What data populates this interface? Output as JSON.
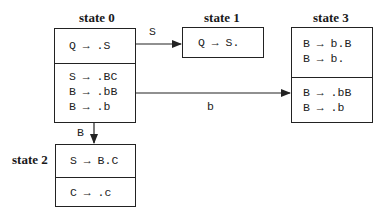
{
  "states": [
    {
      "title": "state 0",
      "kernel": [
        "Q → .S"
      ],
      "closure": [
        "S → .BC",
        "B → .bB",
        "B → .b"
      ]
    },
    {
      "title": "state 1",
      "kernel": [
        "Q → S."
      ],
      "closure": []
    },
    {
      "title": "state 2",
      "kernel": [
        "S → B.C"
      ],
      "closure": [
        "C → .c"
      ]
    },
    {
      "title": "state 3",
      "kernel": [
        "B → b.B",
        "B → b."
      ],
      "closure": [
        "B → .bB",
        "B → .b"
      ]
    }
  ],
  "transitions": [
    {
      "from": "state 0",
      "to": "state 1",
      "label": "S"
    },
    {
      "from": "state 0",
      "to": "state 3",
      "label": "b"
    },
    {
      "from": "state 0",
      "to": "state 2",
      "label": "B"
    }
  ]
}
